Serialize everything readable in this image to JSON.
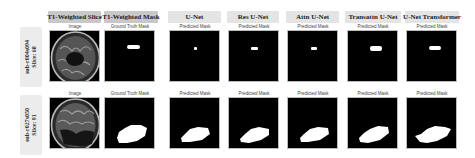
{
  "columns": [
    {
      "title": "T1-Weighted Slice",
      "subtitle": "Image"
    },
    {
      "title": "T1-Weighted Mask",
      "subtitle": "Ground Truth Mask"
    },
    {
      "title": "U-Net",
      "subtitle": "Predicted Mask"
    },
    {
      "title": "Res U-Net",
      "subtitle": "Predicted Mask"
    },
    {
      "title": "Attn U-Net",
      "subtitle": "Predicted Mask"
    },
    {
      "title": "Transattn U-Net",
      "subtitle": "Predicted Mask"
    },
    {
      "title": "U-Net Transformer",
      "subtitle": "Predicted Mask"
    }
  ],
  "rows": [
    {
      "subject": "sub-r004s094",
      "slice": "Slice: 68"
    },
    {
      "subject": "sub-r027s050",
      "slice": "Slice: 91"
    }
  ],
  "colors": {
    "header_bg": "#e4e4e4",
    "header_bg_dark": "#c8c8c8",
    "panel_bg": "#000000",
    "mask": "#ffffff"
  }
}
